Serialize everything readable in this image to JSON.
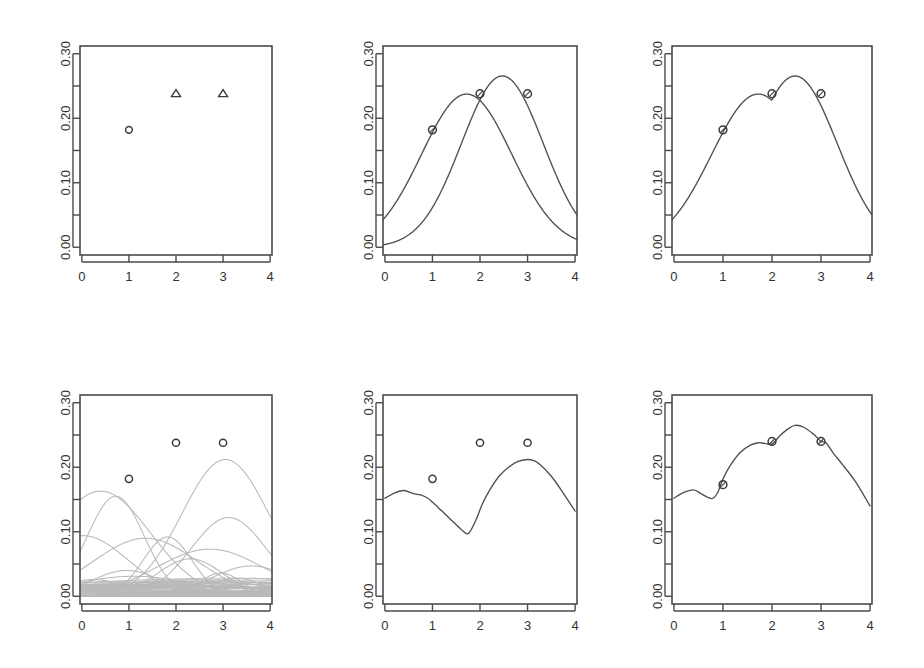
{
  "figure": {
    "title": "",
    "background": "#ffffff",
    "rows": 2,
    "cols": 3,
    "axis_color": "#4a4a4a",
    "curve_color": "#4f4f4f",
    "basis_color": "#b9b9b9",
    "marker_color": "#3c3c3c"
  },
  "axes": {
    "x_ticks": [
      "0",
      "1",
      "2",
      "3",
      "4"
    ],
    "x_tick_values": [
      0,
      1,
      2,
      3,
      4
    ],
    "xlim": [
      -0.04,
      4.04
    ],
    "y_labels": [
      "0.00",
      "0.10",
      "0.20",
      "0.30"
    ],
    "y_label_values": [
      0.0,
      0.1,
      0.2,
      0.3
    ],
    "y_minor_values": [
      0.05,
      0.15,
      0.25
    ],
    "ylim": [
      -0.012,
      0.312
    ]
  },
  "chart_data": [
    {
      "id": "panel-1-observations",
      "type": "scatter",
      "title": "",
      "xlabel": "",
      "ylabel": "",
      "xlim": [
        -0.04,
        4.04
      ],
      "ylim": [
        -0.012,
        0.312
      ],
      "xticks": [
        0,
        1,
        2,
        3,
        4
      ],
      "yticks": [
        0.0,
        0.1,
        0.2,
        0.3
      ],
      "grid": false,
      "legend": "none",
      "series": [
        {
          "name": "observed-circle",
          "marker": "circle",
          "x": [
            1
          ],
          "y": [
            0.182
          ]
        },
        {
          "name": "observed-triangle",
          "marker": "triangle",
          "x": [
            2,
            3
          ],
          "y": [
            0.238,
            0.238
          ]
        }
      ]
    },
    {
      "id": "panel-2-two-gaussians",
      "type": "line",
      "title": "",
      "xlabel": "",
      "ylabel": "",
      "xlim": [
        -0.04,
        4.04
      ],
      "ylim": [
        -0.012,
        0.312
      ],
      "xticks": [
        0,
        1,
        2,
        3,
        4
      ],
      "yticks": [
        0.0,
        0.1,
        0.2,
        0.3
      ],
      "grid": false,
      "legend": "none",
      "series": [
        {
          "name": "gaussian-a",
          "kind": "gaussian",
          "amplitude": 0.2375,
          "mean": 1.72,
          "sigma": 0.95,
          "note": "peaks near x=1.72 at y=0.238"
        },
        {
          "name": "gaussian-b",
          "kind": "gaussian",
          "amplitude": 0.2655,
          "mean": 2.47,
          "sigma": 0.86,
          "note": "peaks near x=2.47 at y=0.265"
        }
      ],
      "points": [
        {
          "marker": "circle-cross",
          "x": 1,
          "y": 0.182
        },
        {
          "marker": "circle-cross",
          "x": 2,
          "y": 0.238
        },
        {
          "marker": "circle-cross",
          "x": 3,
          "y": 0.238
        }
      ]
    },
    {
      "id": "panel-3-envelope",
      "type": "line",
      "title": "",
      "xlabel": "",
      "ylabel": "",
      "xlim": [
        -0.04,
        4.04
      ],
      "ylim": [
        -0.012,
        0.312
      ],
      "xticks": [
        0,
        1,
        2,
        3,
        4
      ],
      "yticks": [
        0.0,
        0.1,
        0.2,
        0.3
      ],
      "grid": false,
      "legend": "none",
      "series": [
        {
          "name": "upper-envelope",
          "kind": "max-of-gaussians",
          "components": [
            {
              "amplitude": 0.2375,
              "mean": 1.72,
              "sigma": 0.95
            },
            {
              "amplitude": 0.2655,
              "mean": 2.47,
              "sigma": 0.86
            }
          ],
          "note": "pointwise maximum, local dip at x≈2.0 down to y≈0.236"
        }
      ],
      "points": [
        {
          "marker": "circle-cross",
          "x": 1,
          "y": 0.182
        },
        {
          "marker": "circle-cross",
          "x": 2,
          "y": 0.238
        },
        {
          "marker": "circle-cross",
          "x": 3,
          "y": 0.238
        }
      ]
    },
    {
      "id": "panel-4-basis-family",
      "type": "line",
      "title": "",
      "xlabel": "",
      "ylabel": "",
      "xlim": [
        -0.04,
        4.04
      ],
      "ylim": [
        -0.012,
        0.312
      ],
      "xticks": [
        0,
        1,
        2,
        3,
        4
      ],
      "yticks": [
        0.0,
        0.1,
        0.2,
        0.3
      ],
      "grid": false,
      "legend": "none",
      "basis_curve_count": 40,
      "series": [
        {
          "name": "basis-01",
          "kind": "gaussian",
          "amplitude": 0.163,
          "mean": 0.4,
          "sigma": 1.05
        },
        {
          "name": "basis-02",
          "kind": "gaussian",
          "amplitude": 0.155,
          "mean": 0.72,
          "sigma": 0.6
        },
        {
          "name": "basis-03",
          "kind": "gaussian",
          "amplitude": 0.212,
          "mean": 3.05,
          "sigma": 0.92
        },
        {
          "name": "basis-04",
          "kind": "gaussian",
          "amplitude": 0.122,
          "mean": 3.12,
          "sigma": 0.8
        },
        {
          "name": "basis-05",
          "kind": "gaussian",
          "amplitude": 0.094,
          "mean": 0.02,
          "sigma": 0.95
        },
        {
          "name": "basis-06",
          "kind": "gaussian",
          "amplitude": 0.09,
          "mean": 1.35,
          "sigma": 1.1
        },
        {
          "name": "basis-07",
          "kind": "gaussian",
          "amplitude": 0.073,
          "mean": 2.72,
          "sigma": 1.15
        },
        {
          "name": "basis-08",
          "kind": "gaussian",
          "amplitude": 0.092,
          "mean": 1.82,
          "sigma": 0.52
        },
        {
          "name": "basis-09",
          "kind": "gaussian",
          "amplitude": 0.058,
          "mean": 2.3,
          "sigma": 0.7
        },
        {
          "name": "basis-10",
          "kind": "gaussian",
          "amplitude": 0.047,
          "mean": 3.6,
          "sigma": 0.85
        },
        {
          "name": "basis-11",
          "kind": "gaussian",
          "amplitude": 0.04,
          "mean": 0.95,
          "sigma": 0.75
        },
        {
          "name": "basis-12",
          "kind": "gaussian",
          "amplitude": 0.036,
          "mean": 2.95,
          "sigma": 0.45
        },
        {
          "name": "basis-13",
          "kind": "gaussian",
          "amplitude": 0.031,
          "mean": 1.1,
          "sigma": 1.3
        },
        {
          "name": "basis-14",
          "kind": "gaussian",
          "amplitude": 0.028,
          "mean": 3.3,
          "sigma": 0.55
        },
        {
          "name": "basis-15",
          "kind": "gaussian",
          "amplitude": 0.026,
          "mean": 0.25,
          "sigma": 0.65
        },
        {
          "name": "basis-16",
          "kind": "gaussian",
          "amplitude": 0.024,
          "mean": 2.05,
          "sigma": 1.4
        },
        {
          "name": "basis-17",
          "kind": "gaussian",
          "amplitude": 0.022,
          "mean": 3.85,
          "sigma": 0.9
        },
        {
          "name": "basis-18",
          "kind": "gaussian",
          "amplitude": 0.02,
          "mean": 1.55,
          "sigma": 0.4
        },
        {
          "name": "basis-19",
          "kind": "gaussian",
          "amplitude": 0.018,
          "mean": 0.6,
          "sigma": 1.6
        },
        {
          "name": "basis-20",
          "kind": "gaussian",
          "amplitude": 0.017,
          "mean": 2.55,
          "sigma": 0.35
        },
        {
          "name": "basis-21",
          "kind": "gaussian",
          "amplitude": 0.016,
          "mean": 3.95,
          "sigma": 0.5
        },
        {
          "name": "basis-22",
          "kind": "gaussian",
          "amplitude": 0.015,
          "mean": 0.1,
          "sigma": 1.2
        },
        {
          "name": "basis-23",
          "kind": "gaussian",
          "amplitude": 0.014,
          "mean": 1.95,
          "sigma": 0.85
        },
        {
          "name": "basis-24",
          "kind": "gaussian",
          "amplitude": 0.013,
          "mean": 3.45,
          "sigma": 1.1
        },
        {
          "name": "basis-25",
          "kind": "gaussian",
          "amplitude": 0.012,
          "mean": 2.2,
          "sigma": 0.3
        },
        {
          "name": "basis-26",
          "kind": "gaussian",
          "amplitude": 0.011,
          "mean": 0.8,
          "sigma": 0.95
        },
        {
          "name": "basis-27",
          "kind": "gaussian",
          "amplitude": 0.01,
          "mean": 2.85,
          "sigma": 1.5
        },
        {
          "name": "basis-28",
          "kind": "gaussian",
          "amplitude": 0.01,
          "mean": 1.25,
          "sigma": 0.45
        },
        {
          "name": "basis-29",
          "kind": "gaussian",
          "amplitude": 0.009,
          "mean": 3.7,
          "sigma": 0.65
        },
        {
          "name": "basis-30",
          "kind": "gaussian",
          "amplitude": 0.009,
          "mean": 0.45,
          "sigma": 0.38
        },
        {
          "name": "basis-31",
          "kind": "gaussian",
          "amplitude": 0.008,
          "mean": 2.45,
          "sigma": 1.0
        },
        {
          "name": "basis-32",
          "kind": "gaussian",
          "amplitude": 0.008,
          "mean": 1.68,
          "sigma": 1.7
        },
        {
          "name": "basis-33",
          "kind": "gaussian",
          "amplitude": 0.007,
          "mean": 3.18,
          "sigma": 0.42
        },
        {
          "name": "basis-34",
          "kind": "gaussian",
          "amplitude": 0.007,
          "mean": 0.05,
          "sigma": 0.55
        },
        {
          "name": "basis-35",
          "kind": "gaussian",
          "amplitude": 0.006,
          "mean": 2.65,
          "sigma": 0.75
        },
        {
          "name": "basis-36",
          "kind": "gaussian",
          "amplitude": 0.006,
          "mean": 1.45,
          "sigma": 1.25
        },
        {
          "name": "basis-37",
          "kind": "gaussian",
          "amplitude": 0.005,
          "mean": 3.9,
          "sigma": 1.35
        },
        {
          "name": "basis-38",
          "kind": "gaussian",
          "amplitude": 0.005,
          "mean": 0.9,
          "sigma": 0.28
        },
        {
          "name": "basis-39",
          "kind": "gaussian",
          "amplitude": 0.004,
          "mean": 2.1,
          "sigma": 0.6
        },
        {
          "name": "basis-40",
          "kind": "gaussian",
          "amplitude": 0.004,
          "mean": 3.55,
          "sigma": 0.32
        }
      ],
      "points": [
        {
          "marker": "circle",
          "x": 1,
          "y": 0.182
        },
        {
          "marker": "circle",
          "x": 2,
          "y": 0.238
        },
        {
          "marker": "circle",
          "x": 3,
          "y": 0.238
        }
      ]
    },
    {
      "id": "panel-5-basis-envelope",
      "type": "line",
      "title": "",
      "xlabel": "",
      "ylabel": "",
      "xlim": [
        -0.04,
        4.04
      ],
      "ylim": [
        -0.012,
        0.312
      ],
      "xticks": [
        0,
        1,
        2,
        3,
        4
      ],
      "yticks": [
        0.0,
        0.1,
        0.2,
        0.3
      ],
      "grid": false,
      "legend": "none",
      "series": [
        {
          "name": "basis-upper-envelope",
          "kind": "polyline",
          "x": [
            0.0,
            0.2,
            0.4,
            0.6,
            0.75,
            0.9,
            1.0,
            1.2,
            1.4,
            1.6,
            1.75,
            1.9,
            2.05,
            2.2,
            2.4,
            2.6,
            2.8,
            3.0,
            3.1,
            3.25,
            3.5,
            3.75,
            4.0
          ],
          "y": [
            0.152,
            0.16,
            0.164,
            0.159,
            0.157,
            0.152,
            0.146,
            0.132,
            0.118,
            0.104,
            0.097,
            0.116,
            0.143,
            0.164,
            0.186,
            0.2,
            0.209,
            0.212,
            0.211,
            0.205,
            0.186,
            0.16,
            0.132
          ]
        }
      ],
      "points": [
        {
          "marker": "circle",
          "x": 1,
          "y": 0.182
        },
        {
          "marker": "circle",
          "x": 2,
          "y": 0.238
        },
        {
          "marker": "circle",
          "x": 3,
          "y": 0.238
        }
      ]
    },
    {
      "id": "panel-6-combined-envelope",
      "type": "line",
      "title": "",
      "xlabel": "",
      "ylabel": "",
      "xlim": [
        -0.04,
        4.04
      ],
      "ylim": [
        -0.012,
        0.312
      ],
      "xticks": [
        0,
        1,
        2,
        3,
        4
      ],
      "yticks": [
        0.0,
        0.1,
        0.2,
        0.3
      ],
      "grid": false,
      "legend": "none",
      "series": [
        {
          "name": "combined-upper-envelope",
          "kind": "polyline",
          "x": [
            0.0,
            0.2,
            0.4,
            0.55,
            0.7,
            0.8,
            0.9,
            1.0,
            1.15,
            1.35,
            1.55,
            1.72,
            1.85,
            2.0,
            2.15,
            2.3,
            2.47,
            2.65,
            2.85,
            3.0,
            3.1,
            3.25,
            3.45,
            3.7,
            4.0
          ],
          "y": [
            0.152,
            0.161,
            0.165,
            0.159,
            0.153,
            0.152,
            0.162,
            0.182,
            0.203,
            0.223,
            0.234,
            0.238,
            0.237,
            0.236,
            0.248,
            0.258,
            0.265,
            0.262,
            0.251,
            0.24,
            0.238,
            0.222,
            0.203,
            0.178,
            0.14
          ]
        }
      ],
      "points": [
        {
          "marker": "circle-cross",
          "x": 1,
          "y": 0.173
        },
        {
          "marker": "circle-cross",
          "x": 2,
          "y": 0.24
        },
        {
          "marker": "circle-cross",
          "x": 3,
          "y": 0.24
        }
      ]
    }
  ]
}
